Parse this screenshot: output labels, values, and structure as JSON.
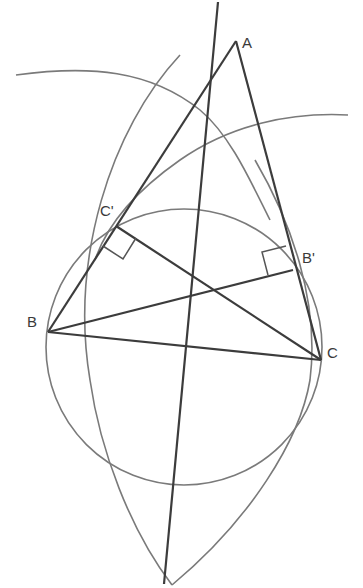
{
  "diagram": {
    "points": [
      {
        "id": "A",
        "label": "A",
        "x": 236,
        "y": 41
      },
      {
        "id": "B",
        "label": "B",
        "x": 48,
        "y": 332
      },
      {
        "id": "C",
        "label": "C",
        "x": 321,
        "y": 360
      },
      {
        "id": "C_prime",
        "label": "C'",
        "x": 116,
        "y": 226
      },
      {
        "id": "B_prime",
        "label": "B'",
        "x": 293,
        "y": 270
      }
    ],
    "labels": {
      "A": "A",
      "B": "B",
      "C": "C",
      "C_prime": "C'",
      "B_prime": "B'"
    },
    "colors": {
      "thick_line": "#3c3c3c",
      "thin_line": "#7a7a7a",
      "label": "#3a3a3a",
      "background": "#ffffff"
    }
  }
}
